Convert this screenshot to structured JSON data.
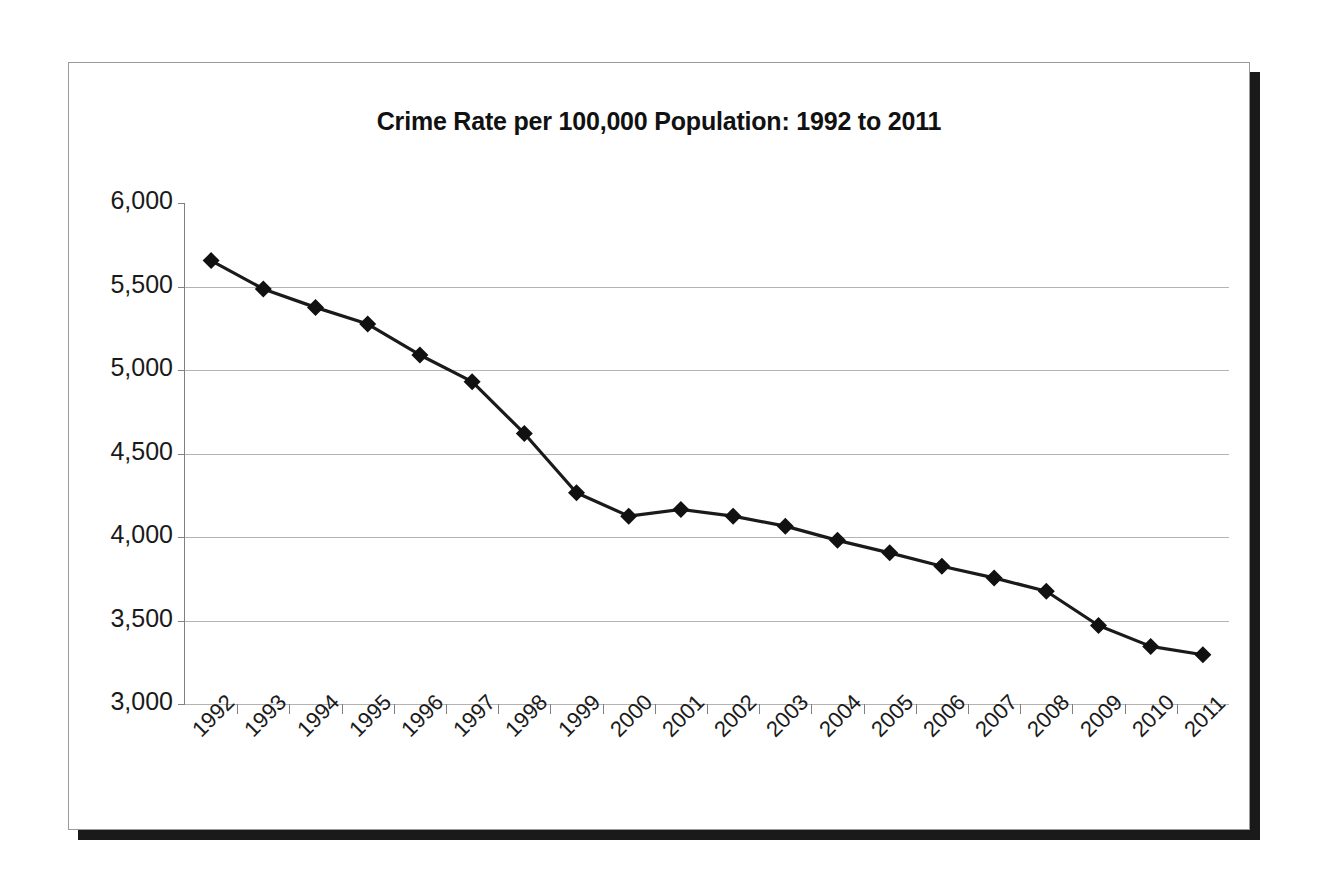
{
  "chart_data": {
    "type": "line",
    "title": "Crime Rate per 100,000 Population: 1992 to 2011",
    "xlabel": "",
    "ylabel": "",
    "categories": [
      "1992",
      "1993",
      "1994",
      "1995",
      "1996",
      "1997",
      "1998",
      "1999",
      "2000",
      "2001",
      "2002",
      "2003",
      "2004",
      "2005",
      "2006",
      "2007",
      "2008",
      "2009",
      "2010",
      "2011"
    ],
    "values": [
      5655,
      5485,
      5375,
      5275,
      5090,
      4930,
      4620,
      4265,
      4125,
      4165,
      4125,
      4065,
      3980,
      3905,
      3825,
      3755,
      3675,
      3470,
      3345,
      3295
    ],
    "series": [
      {
        "name": "Crime Rate per 100,000 Population",
        "values": [
          5655,
          5485,
          5375,
          5275,
          5090,
          4930,
          4620,
          4265,
          4125,
          4165,
          4125,
          4065,
          3980,
          3905,
          3825,
          3755,
          3675,
          3470,
          3345,
          3295
        ]
      }
    ],
    "ylim": [
      3000,
      6000
    ],
    "ytick_values": [
      6000,
      5500,
      5000,
      4500,
      4000,
      3500,
      3000
    ],
    "ytick_labels": [
      "6,000",
      "5,500",
      "5,000",
      "4,500",
      "4,000",
      "3,500",
      "3,000"
    ],
    "grid": true,
    "legend": "none",
    "marker": "diamond",
    "line_color": "#1a1a1a",
    "marker_color": "#111111",
    "grid_color": "#b3b3b3",
    "background_color": "#ffffff",
    "xtick_label_rotation": -45
  },
  "frame": {
    "border_color": "#9a9a9a",
    "shadow_color": "#1a1a1a"
  }
}
